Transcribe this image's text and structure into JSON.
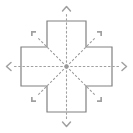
{
  "figure": {
    "background_color": "#ffffff",
    "width": 133,
    "height": 133
  },
  "shape": {
    "name": "greek-cross",
    "stroke_color": "#808080",
    "fill_color": "#ffffff",
    "stroke_width": 1.2,
    "arm_width": 38,
    "bounds": {
      "left": 21,
      "top": 21,
      "right": 112,
      "bottom": 112
    },
    "notch": {
      "near": 47,
      "far": 86
    }
  },
  "center": {
    "name": "center-node",
    "x": 66.5,
    "y": 66.5,
    "color": "#9a9a9a",
    "radius": 2.2
  },
  "rays": {
    "style": "dotted",
    "color": "#a0a0a0",
    "stroke_width": 1.1,
    "dash": "1.6 2.6",
    "count": 8
  },
  "arrows": [
    {
      "id": "arrow-north",
      "direction": "up",
      "label": "N",
      "angle_deg": 270,
      "head_style": "chevron",
      "tip_x": 66.5,
      "tip_y": 6.5,
      "ray_end_x": 66.5,
      "ray_end_y": 12
    },
    {
      "id": "arrow-east",
      "direction": "right",
      "label": "E",
      "angle_deg": 0,
      "head_style": "chevron",
      "tip_x": 126.5,
      "tip_y": 66.5,
      "ray_end_x": 121,
      "ray_end_y": 66.5
    },
    {
      "id": "arrow-south",
      "direction": "down",
      "label": "S",
      "angle_deg": 90,
      "head_style": "chevron",
      "tip_x": 66.5,
      "tip_y": 126.5,
      "ray_end_x": 66.5,
      "ray_end_y": 121
    },
    {
      "id": "arrow-west",
      "direction": "left",
      "label": "W",
      "angle_deg": 180,
      "head_style": "chevron",
      "tip_x": 6.5,
      "tip_y": 66.5,
      "ray_end_x": 12,
      "ray_end_y": 66.5
    },
    {
      "id": "arrow-northeast",
      "direction": "up-right",
      "label": "NE",
      "angle_deg": 315,
      "head_style": "bracket",
      "tip_x": 99.5,
      "tip_y": 33.5,
      "ray_end_x": 95,
      "ray_end_y": 38
    },
    {
      "id": "arrow-southeast",
      "direction": "down-right",
      "label": "SE",
      "angle_deg": 45,
      "head_style": "bracket",
      "tip_x": 99.5,
      "tip_y": 99.5,
      "ray_end_x": 95,
      "ray_end_y": 95
    },
    {
      "id": "arrow-southwest",
      "direction": "down-left",
      "label": "SW",
      "angle_deg": 135,
      "head_style": "bracket",
      "tip_x": 33.5,
      "tip_y": 99.5,
      "ray_end_x": 38,
      "ray_end_y": 95
    },
    {
      "id": "arrow-northwest",
      "direction": "up-left",
      "label": "NW",
      "angle_deg": 225,
      "head_style": "bracket",
      "tip_x": 33.5,
      "tip_y": 33.5,
      "ray_end_x": 38,
      "ray_end_y": 38
    }
  ]
}
